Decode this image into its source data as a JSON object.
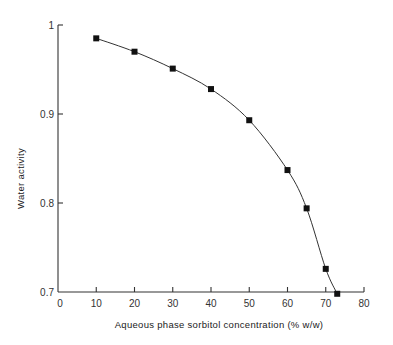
{
  "chart_data": {
    "type": "line",
    "title": "",
    "xlabel": "Aqueous phase sorbitol concentration (% w/w)",
    "ylabel": "Water activity",
    "xlim": [
      0,
      80
    ],
    "ylim": [
      0.7,
      1.0
    ],
    "x_ticks": [
      0,
      10,
      20,
      30,
      40,
      50,
      60,
      70,
      80
    ],
    "x_tick_labels": [
      "0",
      "10",
      "20",
      "30",
      "40",
      "50",
      "60",
      "70",
      "80"
    ],
    "y_ticks": [
      0.7,
      0.8,
      0.9,
      1.0
    ],
    "y_tick_labels": [
      "0.7",
      "0.8",
      "0.9",
      "1"
    ],
    "grid": false,
    "legend": null,
    "series": [
      {
        "name": "Water activity",
        "marker": "square",
        "smooth": true,
        "x": [
          10,
          20,
          30,
          40,
          50,
          60,
          65,
          70,
          73
        ],
        "y": [
          0.985,
          0.97,
          0.951,
          0.928,
          0.893,
          0.837,
          0.794,
          0.726,
          0.698
        ]
      }
    ]
  }
}
